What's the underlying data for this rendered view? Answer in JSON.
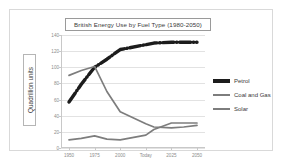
{
  "chart_data": {
    "type": "line",
    "title": "British Energy Use by Fuel Type (1980-2050)",
    "xlabel": "",
    "ylabel": "Quadrillion units",
    "categories": [
      "1950",
      "1975",
      "2000",
      "Today",
      "2025",
      "2050"
    ],
    "xticks": [
      "1950",
      "1975",
      "2000",
      "Today",
      "2025",
      "2050"
    ],
    "yticks": [
      "0",
      "20",
      "40",
      "60",
      "80",
      "100",
      "120",
      "140"
    ],
    "ylim": [
      0,
      140
    ],
    "grid": true,
    "legend_position": "right",
    "series": [
      {
        "name": "Petrol",
        "color": "#1c1c1c",
        "style": "dash-dot",
        "x": [
          "1950",
          "1962",
          "1975",
          "1987",
          "2000",
          "Today",
          "2012",
          "2025",
          "2037",
          "2050"
        ],
        "values": [
          57,
          79,
          100,
          110,
          122,
          128,
          130,
          131,
          131,
          131
        ]
      },
      {
        "name": "Coal and Gas",
        "color": "#7d7d7d",
        "style": "solid",
        "x": [
          "1950",
          "1962",
          "1975",
          "1987",
          "2000",
          "Today",
          "2012",
          "2025",
          "2037",
          "2050"
        ],
        "values": [
          90,
          96,
          101,
          70,
          45,
          30,
          26,
          25,
          26,
          28
        ]
      },
      {
        "name": "Solar",
        "color": "#7d7d7d",
        "style": "solid",
        "x": [
          "1950",
          "1962",
          "1975",
          "1987",
          "2000",
          "Today",
          "2012",
          "2025",
          "2037",
          "2050"
        ],
        "values": [
          10,
          12,
          15,
          11,
          10,
          16,
          23,
          31,
          31,
          31
        ]
      }
    ]
  },
  "chart": {
    "title": "British Energy Use by Fuel Type (1980-2050)",
    "y_axis_title": "Quadrillion units"
  },
  "legend": {
    "items": [
      {
        "label": "Petrol"
      },
      {
        "label": "Coal and Gas"
      },
      {
        "label": "Solar"
      }
    ]
  }
}
